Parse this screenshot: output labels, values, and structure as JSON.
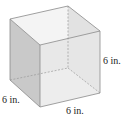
{
  "figure": {
    "shape": "cube",
    "labels": {
      "height": "6 in.",
      "depth": "6 in.",
      "width": "6 in."
    },
    "colors": {
      "left_face": "#c9c9c9",
      "top_face": "#f4f4f4",
      "front_face": "#e6e6e6",
      "bottom_face": "#f7f7f7",
      "edge": "#8a8a8a"
    }
  }
}
